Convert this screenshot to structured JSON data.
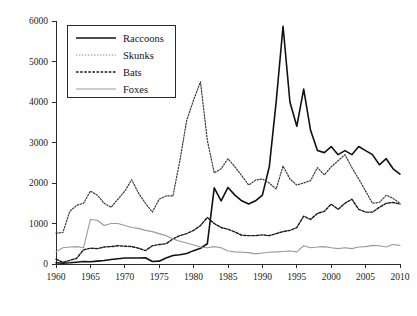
{
  "chart_data": {
    "type": "line",
    "title": "",
    "subtitle": "",
    "xlabel": "",
    "ylabel": "",
    "xlim": [
      1960,
      2010
    ],
    "ylim": [
      0,
      6000
    ],
    "grid": false,
    "legend_position": "top-left",
    "xticks": [
      1960,
      1965,
      1970,
      1975,
      1980,
      1985,
      1990,
      1995,
      2000,
      2005,
      2010
    ],
    "yticks": [
      0,
      1000,
      2000,
      3000,
      4000,
      5000,
      6000
    ],
    "xtick_labels": [
      "1960",
      "1965",
      "1970",
      "1975",
      "1980",
      "1985",
      "1990",
      "1995",
      "2000",
      "2005",
      "2010"
    ],
    "ytick_labels": [
      "0",
      "1000",
      "2000",
      "3000",
      "4000",
      "5000",
      "6000"
    ],
    "x": [
      1960,
      1961,
      1962,
      1963,
      1964,
      1965,
      1966,
      1967,
      1968,
      1969,
      1970,
      1971,
      1972,
      1973,
      1974,
      1975,
      1976,
      1977,
      1978,
      1979,
      1980,
      1981,
      1982,
      1983,
      1984,
      1985,
      1986,
      1987,
      1988,
      1989,
      1990,
      1991,
      1992,
      1993,
      1994,
      1995,
      1996,
      1997,
      1998,
      1999,
      2000,
      2001,
      2002,
      2003,
      2004,
      2005,
      2006,
      2007,
      2008,
      2009,
      2010
    ],
    "series": [
      {
        "name": "Raccoons",
        "style": "solid",
        "color": "#111111",
        "width": 1.6,
        "values": [
          30,
          20,
          30,
          45,
          60,
          55,
          70,
          85,
          110,
          130,
          150,
          150,
          150,
          155,
          60,
          70,
          150,
          210,
          230,
          260,
          330,
          390,
          500,
          1880,
          1560,
          1890,
          1700,
          1560,
          1480,
          1560,
          1700,
          2400,
          4000,
          5870,
          4000,
          3400,
          4320,
          3300,
          2800,
          2750,
          2900,
          2700,
          2800,
          2700,
          2900,
          2800,
          2700,
          2450,
          2600,
          2350,
          2220
        ]
      },
      {
        "name": "Skunks",
        "style": "dotted-light",
        "color": "#3a3a3a",
        "width": 1.2,
        "values": [
          760,
          780,
          1300,
          1450,
          1500,
          1800,
          1700,
          1500,
          1400,
          1600,
          1800,
          2080,
          1750,
          1500,
          1280,
          1600,
          1680,
          1680,
          2550,
          3550,
          4050,
          4500,
          3050,
          2250,
          2350,
          2600,
          2400,
          2180,
          1950,
          2070,
          2100,
          2000,
          1850,
          2420,
          2100,
          1950,
          2000,
          2060,
          2380,
          2200,
          2400,
          2550,
          2700,
          2380,
          2100,
          1800,
          1500,
          1520,
          1700,
          1620,
          1500
        ]
      },
      {
        "name": "Bats",
        "style": "dashed-dark",
        "color": "#1a1a1a",
        "width": 1.4,
        "values": [
          120,
          40,
          90,
          140,
          350,
          390,
          380,
          420,
          430,
          450,
          440,
          430,
          390,
          330,
          450,
          480,
          500,
          620,
          700,
          750,
          830,
          950,
          1150,
          1000,
          900,
          860,
          790,
          710,
          700,
          700,
          720,
          700,
          750,
          800,
          830,
          900,
          1180,
          1100,
          1250,
          1300,
          1480,
          1350,
          1500,
          1600,
          1350,
          1280,
          1280,
          1400,
          1500,
          1520,
          1480
        ]
      },
      {
        "name": "Foxes",
        "style": "solid-gray",
        "color": "#9a9a9a",
        "width": 1.1,
        "values": [
          300,
          400,
          420,
          430,
          400,
          1100,
          1080,
          950,
          1000,
          1000,
          950,
          900,
          880,
          830,
          800,
          750,
          700,
          620,
          560,
          520,
          470,
          420,
          400,
          430,
          400,
          320,
          300,
          290,
          280,
          250,
          270,
          290,
          300,
          310,
          320,
          300,
          450,
          400,
          420,
          430,
          400,
          380,
          400,
          380,
          420,
          430,
          460,
          450,
          420,
          480,
          460
        ]
      }
    ],
    "legend_entries": [
      {
        "label": "Raccoons",
        "style": "solid",
        "color": "#111111"
      },
      {
        "label": "Skunks",
        "style": "dotted-light",
        "color": "#8a8a8a"
      },
      {
        "label": "Bats",
        "style": "dashed-dark",
        "color": "#1a1a1a"
      },
      {
        "label": "Foxes",
        "style": "solid-gray",
        "color": "#9a9a9a"
      }
    ]
  },
  "plot": {
    "background": "#ffffff",
    "axis_color": "#2b2b2b"
  }
}
